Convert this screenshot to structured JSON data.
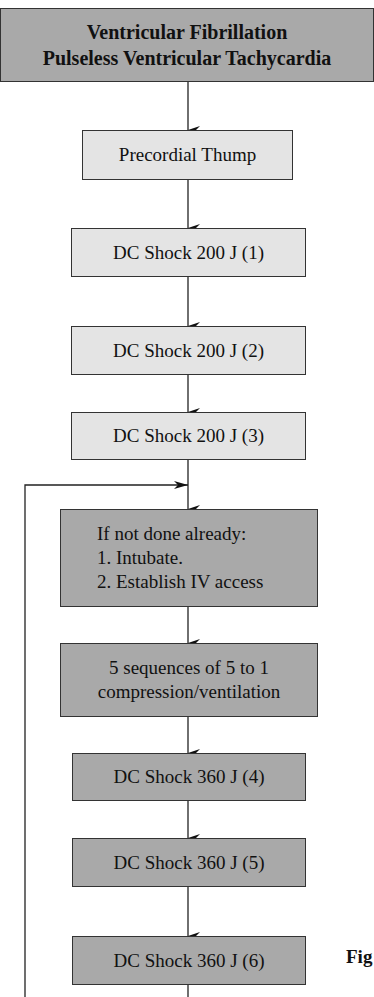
{
  "flowchart": {
    "title_box": {
      "lines": [
        "Ventricular Fibrillation",
        "Pulseless Ventricular Tachycardia"
      ]
    },
    "steps": [
      {
        "label": "Precordial Thump"
      },
      {
        "label": "DC Shock 200 J (1)"
      },
      {
        "label": "DC Shock 200 J (2)"
      },
      {
        "label": "DC Shock 200 J (3)"
      },
      {
        "lines": [
          "If not done already:",
          "1. Intubate.",
          "2. Establish IV access"
        ]
      },
      {
        "lines": [
          "5 sequences of 5 to 1",
          "compression/ventilation"
        ]
      },
      {
        "label": "DC Shock 360 J (4)"
      },
      {
        "label": "DC Shock 360 J (5)"
      },
      {
        "label": "DC Shock 360 J (6)"
      }
    ],
    "figure_label": "Fig"
  },
  "colors": {
    "title_fill": "#a9a9a9",
    "light_fill": "#e4e4e4",
    "dark_fill": "#a9a9a9",
    "line": "#222222"
  }
}
